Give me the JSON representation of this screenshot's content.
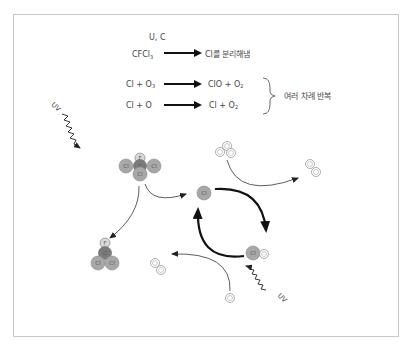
{
  "diagram": {
    "title": "",
    "equations": [
      {
        "left": "CFCl",
        "left_sub": "3",
        "over_arrow": "U, C",
        "right": "Cl를 분리해냄"
      },
      {
        "left": "Cl + O",
        "left_sub": "3",
        "over_arrow": "",
        "right": "ClO + O",
        "right_sub": "2"
      },
      {
        "left": "Cl + O",
        "left_sub": "",
        "over_arrow": "",
        "right": "Cl + O",
        "right_sub": "2"
      }
    ],
    "brace_label": "여러 차례 반복",
    "uv_label_1": "UV",
    "uv_label_2": "UV",
    "atoms": {
      "F": "F",
      "C": "C",
      "Cl": "Cl",
      "O": "O"
    },
    "colors": {
      "frame": "#c8c8c8",
      "arrow": "#111111",
      "thin_line": "#333333",
      "cl_fill": "#a8a8a8",
      "c_fill": "#7a7a7a",
      "f_fill": "#d8d8d8",
      "o_fill": "#ffffff"
    }
  }
}
